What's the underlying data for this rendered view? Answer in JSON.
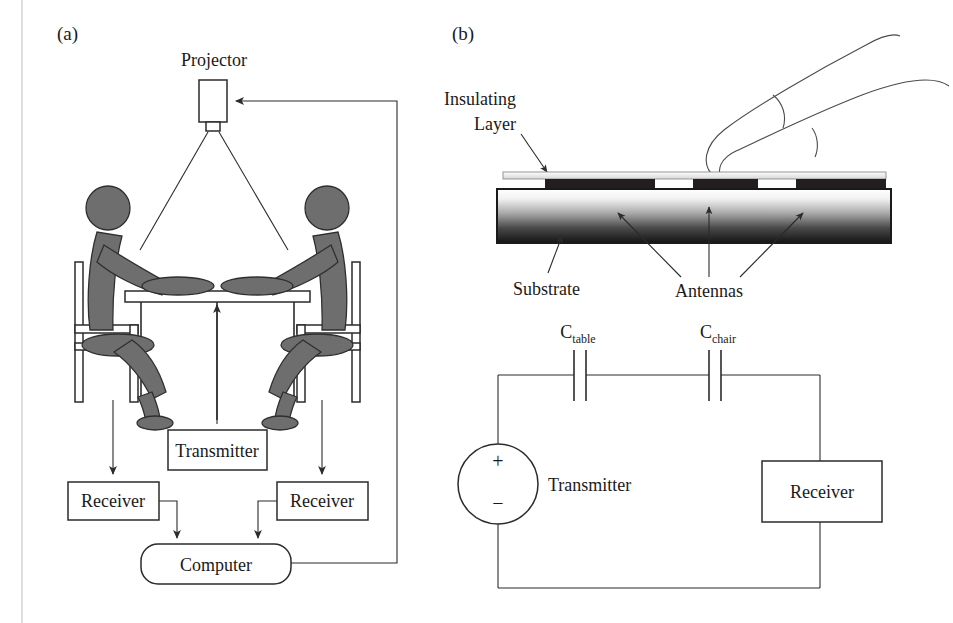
{
  "figure": {
    "panel_a_label": "(a)",
    "panel_b_label": "(b)"
  },
  "panel_a": {
    "projector_label": "Projector",
    "transmitter_label": "Transmitter",
    "receiver_left_label": "Receiver",
    "receiver_right_label": "Receiver",
    "computer_label": "Computer",
    "scene": {
      "person_count": 2,
      "chair_count": 2,
      "table_count": 1
    }
  },
  "panel_b": {
    "insulating_layer_label_line1": "Insulating",
    "insulating_layer_label_line2": "Layer",
    "substrate_label": "Substrate",
    "antennas_label": "Antennas",
    "antenna_count": 3,
    "finger_present": true
  },
  "circuit": {
    "cap_table_symbol": "C",
    "cap_table_sub": "table",
    "cap_chair_symbol": "C",
    "cap_chair_sub": "chair",
    "transmitter_label": "Transmitter",
    "receiver_label": "Receiver",
    "plus_sign": "+",
    "minus_sign": "−"
  },
  "colors": {
    "ink": "#2b2b2b",
    "body_fill": "#6e6e6e",
    "antenna_fill": "#231f20",
    "page_background": "#ffffff",
    "margin_rule": "#c9c9c9"
  }
}
